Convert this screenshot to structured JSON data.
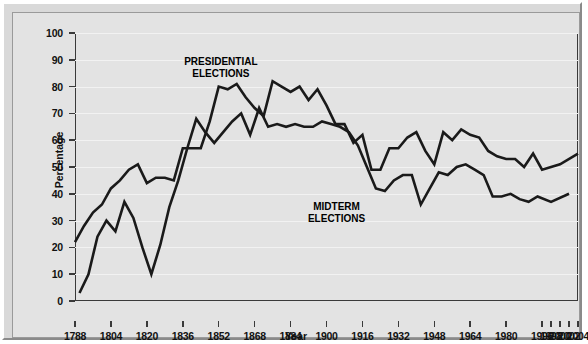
{
  "chart_data": {
    "type": "line",
    "title": "",
    "xlabel": "Year",
    "ylabel": "Percentage",
    "ylim": [
      0,
      100
    ],
    "ytick_values": [
      0,
      10,
      20,
      30,
      40,
      50,
      60,
      70,
      80,
      90,
      100
    ],
    "grid": true,
    "legend_position": "inline-annotations",
    "categories": [
      "1788",
      "1792",
      "1796",
      "1800",
      "1804",
      "1808",
      "1812",
      "1816",
      "1820",
      "1824",
      "1828",
      "1832",
      "1836",
      "1840",
      "1844",
      "1848",
      "1852",
      "1856",
      "1860",
      "1864",
      "1868",
      "1872",
      "1876",
      "1880",
      "1884",
      "1888",
      "1892",
      "1896",
      "1900",
      "1904",
      "1908",
      "1912",
      "1916",
      "1920",
      "1924",
      "1928",
      "1932",
      "1936",
      "1940",
      "1944",
      "1948",
      "1952",
      "1956",
      "1960",
      "1964",
      "1968",
      "1972",
      "1976",
      "1980",
      "1984",
      "1988",
      "1992",
      "1996",
      "1998",
      "2000",
      "2002",
      "2004"
    ],
    "xtick_labels": [
      "1788",
      "1804",
      "1820",
      "1836",
      "1852",
      "1868",
      "1884",
      "1900",
      "1916",
      "1932",
      "1948",
      "1964",
      "1980",
      "1996",
      "1998",
      "2000",
      "2002",
      "2004"
    ],
    "series": [
      {
        "name": "PRESIDENTIAL ELECTIONS",
        "color": "#1a1a1a",
        "x": [
          "1788",
          "1792",
          "1796",
          "1800",
          "1804",
          "1808",
          "1812",
          "1816",
          "1820",
          "1824",
          "1828",
          "1832",
          "1836",
          "1840",
          "1844",
          "1848",
          "1852",
          "1856",
          "1860",
          "1864",
          "1868",
          "1872",
          "1876",
          "1880",
          "1884",
          "1888",
          "1892",
          "1896",
          "1900",
          "1904",
          "1908",
          "1912",
          "1916",
          "1920",
          "1924",
          "1928",
          "1932",
          "1936",
          "1940",
          "1944",
          "1948",
          "1952",
          "1956",
          "1960",
          "1964",
          "1968",
          "1972",
          "1976",
          "1980",
          "1984",
          "1988",
          "1992",
          "1996",
          "2000",
          "2004"
        ],
        "values": [
          22,
          28,
          33,
          36,
          42,
          45,
          49,
          51,
          44,
          46,
          46,
          45,
          57,
          57,
          57,
          67,
          80,
          79,
          81,
          76,
          72,
          69,
          82,
          80,
          78,
          80,
          75,
          79,
          73,
          66,
          66,
          59,
          62,
          49,
          49,
          57,
          57,
          61,
          63,
          56,
          51,
          63,
          60,
          64,
          62,
          61,
          56,
          54,
          53,
          53,
          50,
          55,
          49,
          51,
          55
        ],
        "values_tail_recent": [
          49,
          51,
          55,
          61,
          61
        ]
      },
      {
        "name": "MIDTERM ELECTIONS",
        "color": "#1a1a1a",
        "x": [
          "1790",
          "1794",
          "1798",
          "1802",
          "1806",
          "1810",
          "1814",
          "1818",
          "1822",
          "1826",
          "1830",
          "1834",
          "1838",
          "1842",
          "1846",
          "1850",
          "1854",
          "1858",
          "1862",
          "1866",
          "1870",
          "1874",
          "1878",
          "1882",
          "1886",
          "1890",
          "1894",
          "1898",
          "1902",
          "1906",
          "1910",
          "1914",
          "1918",
          "1922",
          "1926",
          "1930",
          "1934",
          "1938",
          "1942",
          "1946",
          "1950",
          "1954",
          "1958",
          "1962",
          "1966",
          "1970",
          "1974",
          "1978",
          "1982",
          "1986",
          "1990",
          "1994",
          "1998",
          "2002"
        ],
        "values": [
          3,
          10,
          24,
          30,
          26,
          37,
          31,
          20,
          10,
          21,
          35,
          45,
          57,
          68,
          63,
          59,
          63,
          67,
          70,
          62,
          72,
          65,
          66,
          65,
          66,
          65,
          65,
          67,
          66,
          65,
          63,
          58,
          50,
          42,
          41,
          45,
          47,
          47,
          36,
          42,
          48,
          47,
          50,
          51,
          49,
          47,
          39,
          39,
          40,
          38,
          37,
          39,
          37,
          40
        ]
      }
    ],
    "annotations": [
      {
        "text_line1": "PRESIDENTIAL",
        "text_line2": "ELECTIONS",
        "x_pct": 29,
        "y_pct": 87
      },
      {
        "text_line1": "MIDTERM",
        "text_line2": "ELECTIONS",
        "x_pct": 52,
        "y_pct": 33
      }
    ]
  },
  "axes": {
    "y_title": "Percentage",
    "x_title": "Year"
  }
}
